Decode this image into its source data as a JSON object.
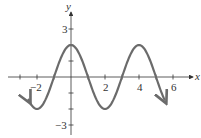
{
  "chart_data": {
    "type": "line",
    "title": "",
    "xlabel": "x",
    "ylabel": "y",
    "function": "y = 2cos(πx/2)",
    "xlim": [
      -3,
      7
    ],
    "ylim": [
      -3,
      3
    ],
    "x_ticks": [
      -3,
      -2,
      -1,
      1,
      2,
      3,
      4,
      5,
      6
    ],
    "x_tick_labels": [
      "-2",
      "2",
      "4",
      "6"
    ],
    "x_tick_label_values": [
      -2,
      2,
      4,
      6
    ],
    "y_ticks": [
      -3,
      -2,
      -1,
      1,
      2,
      3
    ],
    "y_tick_labels": [
      "3",
      "-3"
    ],
    "y_tick_label_values": [
      3,
      -3
    ],
    "grid": false,
    "legend": null,
    "series": [
      {
        "name": "curve",
        "color": "#6b6b6b",
        "x_range": [
          -2.5,
          5.5
        ],
        "x": [
          -2.5,
          -2,
          -1,
          0,
          1,
          2,
          3,
          4,
          5,
          5.5
        ],
        "values": [
          -1.41,
          -2,
          0,
          2,
          0,
          -2,
          0,
          2,
          0,
          -1.41
        ],
        "arrows": "both ends"
      }
    ]
  },
  "labels": {
    "x_axis": "x",
    "y_axis": "y",
    "tick_neg2": "−2",
    "tick_2": "2",
    "tick_4": "4",
    "tick_6": "6",
    "tick_y3": "3",
    "tick_yneg3": "−3"
  }
}
